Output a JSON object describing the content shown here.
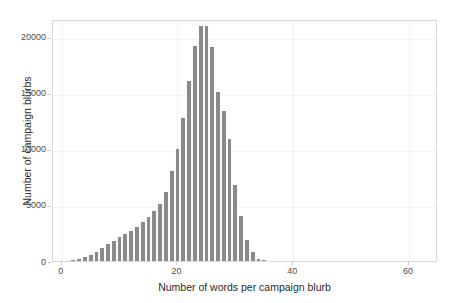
{
  "chart_data": {
    "type": "bar",
    "title": "",
    "subtitle": "",
    "xlabel": "Number of words per campaign blurb",
    "ylabel": "Number of campaign blurbs",
    "xlim": [
      -1.5,
      65
    ],
    "ylim": [
      0,
      21600
    ],
    "grid": true,
    "legend": null,
    "bin_width": 1,
    "xticks": [
      0,
      20,
      40,
      60
    ],
    "xtick_labels": [
      "0",
      "20",
      "40",
      "60"
    ],
    "yticks": [
      0,
      5000,
      10000,
      15000,
      20000
    ],
    "ytick_labels": [
      "0",
      "5000",
      "10000",
      "15000",
      "20000"
    ],
    "bar_color": "#8a8a8a",
    "panel_border_color": "#d9d9d9",
    "gridline_color": "#f2f2f2",
    "categories": [
      1,
      2,
      3,
      4,
      5,
      6,
      7,
      8,
      9,
      10,
      11,
      12,
      13,
      14,
      15,
      16,
      17,
      18,
      19,
      20,
      21,
      22,
      23,
      24,
      25,
      26,
      27,
      28,
      29,
      30,
      31,
      32,
      33,
      34,
      35,
      36,
      37
    ],
    "values": [
      0,
      60,
      190,
      330,
      560,
      820,
      1150,
      1480,
      1780,
      2100,
      2400,
      2700,
      3050,
      3500,
      3900,
      4500,
      5100,
      6200,
      8000,
      10000,
      12800,
      16100,
      19200,
      21000,
      20950,
      19100,
      15100,
      13400,
      10900,
      6800,
      4000,
      1900,
      800,
      200,
      60,
      20,
      0
    ],
    "series": [
      {
        "name": "Campaign blurbs",
        "values": [
          0,
          60,
          190,
          330,
          560,
          820,
          1150,
          1480,
          1780,
          2100,
          2400,
          2700,
          3050,
          3500,
          3900,
          4500,
          5100,
          6200,
          8000,
          10000,
          12800,
          16100,
          19200,
          21000,
          20950,
          19100,
          15100,
          13400,
          10900,
          6800,
          4000,
          1900,
          800,
          200,
          60,
          20,
          0
        ]
      }
    ],
    "annotations": [],
    "peak_bin": 24,
    "peak_value": 21000
  }
}
